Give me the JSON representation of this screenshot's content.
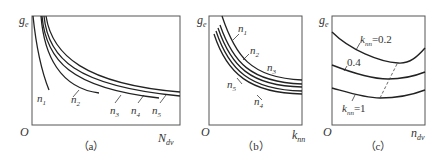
{
  "figure": {
    "panels": [
      {
        "id": "a",
        "caption": "（a）",
        "y_axis_label": "g",
        "y_axis_sub": "e",
        "x_axis_label": "N",
        "x_axis_sub": "dv",
        "origin_label": "O",
        "curve_labels": [
          {
            "base": "n",
            "sub": "1"
          },
          {
            "base": "n",
            "sub": "2"
          },
          {
            "base": "n",
            "sub": "3"
          },
          {
            "base": "n",
            "sub": "4"
          },
          {
            "base": "n",
            "sub": "5"
          }
        ]
      },
      {
        "id": "b",
        "caption": "（b）",
        "y_axis_label": "g",
        "y_axis_sub": "e",
        "x_axis_label": "k",
        "x_axis_sub": "nn",
        "origin_label": "O",
        "curve_labels": [
          {
            "base": "n",
            "sub": "1"
          },
          {
            "base": "n",
            "sub": "2"
          },
          {
            "base": "n",
            "sub": "3"
          },
          {
            "base": "n",
            "sub": "4"
          },
          {
            "base": "n",
            "sub": "5"
          }
        ]
      },
      {
        "id": "c",
        "caption": "（c）",
        "y_axis_label": "g",
        "y_axis_sub": "e",
        "x_axis_label": "n",
        "x_axis_sub": "dv",
        "origin_label": "O",
        "curve_labels": [
          {
            "base": "k",
            "sub": "nn",
            "value": "=0.2"
          },
          {
            "value": "0.4"
          },
          {
            "base": "k",
            "sub": "nn",
            "value": "=1"
          }
        ]
      }
    ],
    "line_color": "#222222",
    "frame_color": "#555555"
  }
}
